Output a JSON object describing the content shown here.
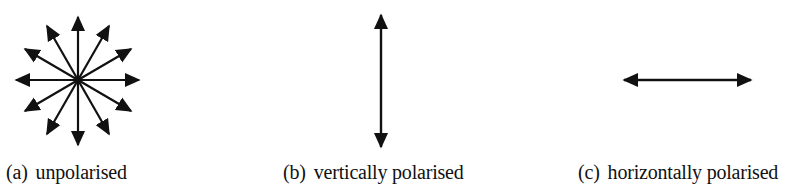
{
  "figure": {
    "panels": [
      {
        "id": "a",
        "label": "(a)",
        "caption": "unpolarised",
        "arrows": "12 radial double-headed directions (every 30°)"
      },
      {
        "id": "b",
        "label": "(b)",
        "caption": "vertically polarised",
        "arrows": "single vertical double-headed arrow"
      },
      {
        "id": "c",
        "label": "(c)",
        "caption": "horizontally polarised",
        "arrows": "single horizontal double-headed arrow"
      }
    ],
    "stroke_color": "#111111",
    "background_color": "#ffffff"
  }
}
